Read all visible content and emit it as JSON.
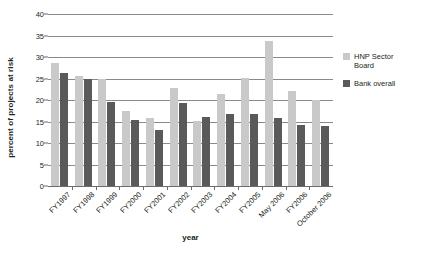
{
  "chart_data": {
    "type": "bar",
    "title": "",
    "xlabel": "year",
    "ylabel": "percent of projects at risk",
    "ylim": [
      0,
      40
    ],
    "yticks": [
      0,
      5,
      10,
      15,
      20,
      25,
      30,
      35,
      40
    ],
    "grid": true,
    "legend_position": "right",
    "categories": [
      "FY1997",
      "FY1998",
      "FY1999",
      "FY2000",
      "FY2001",
      "FY2002",
      "FY2003",
      "FY2004",
      "FY2005",
      "May 2006",
      "FY2006",
      "October 2006"
    ],
    "series": [
      {
        "name": "HNP Sector Board",
        "color": "#c9c9c9",
        "values": [
          28.7,
          25.5,
          25.0,
          17.5,
          15.8,
          22.8,
          15.2,
          21.5,
          25.2,
          33.8,
          22.0,
          20.0
        ]
      },
      {
        "name": "Bank overall",
        "color": "#5a5a5a",
        "values": [
          26.2,
          24.8,
          19.5,
          15.3,
          13.0,
          19.4,
          16.0,
          16.7,
          16.7,
          15.9,
          14.3,
          14.0
        ]
      }
    ]
  },
  "axis": {
    "y_title": "percent of projects at risk",
    "x_title": "year",
    "y_tick_labels": [
      "0",
      "5",
      "10",
      "15",
      "20",
      "25",
      "30",
      "35",
      "40"
    ],
    "x_tick_labels": [
      "FY1997",
      "FY1998",
      "FY1999",
      "FY2000",
      "FY2001",
      "FY2002",
      "FY2003",
      "FY2004",
      "FY2005",
      "May 2006",
      "FY2006",
      "October 2006"
    ]
  },
  "legend": {
    "entries": [
      {
        "label": "HNP Sector Board",
        "color": "#c9c9c9"
      },
      {
        "label": "Bank overall",
        "color": "#5a5a5a"
      }
    ]
  }
}
